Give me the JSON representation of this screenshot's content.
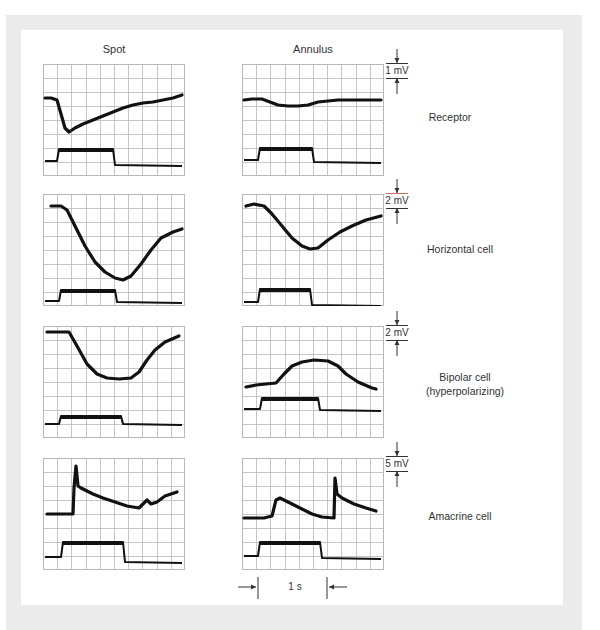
{
  "figure": {
    "column_titles": [
      "Spot",
      "Annulus"
    ],
    "rows": [
      {
        "label_lines": [
          "Receptor"
        ],
        "scale_label": "1 mV",
        "spot_trace": [
          [
            2,
            34
          ],
          [
            8,
            34
          ],
          [
            14,
            36
          ],
          [
            18,
            50
          ],
          [
            22,
            64
          ],
          [
            26,
            68
          ],
          [
            32,
            64
          ],
          [
            40,
            60
          ],
          [
            50,
            56
          ],
          [
            60,
            52
          ],
          [
            70,
            48
          ],
          [
            80,
            44
          ],
          [
            90,
            41
          ],
          [
            100,
            39
          ],
          [
            110,
            38
          ],
          [
            120,
            36
          ],
          [
            130,
            34
          ],
          [
            139,
            31
          ]
        ],
        "annulus_trace": [
          [
            2,
            36
          ],
          [
            10,
            35
          ],
          [
            20,
            35
          ],
          [
            28,
            38
          ],
          [
            36,
            41
          ],
          [
            46,
            42
          ],
          [
            56,
            42
          ],
          [
            66,
            41
          ],
          [
            76,
            38
          ],
          [
            86,
            37
          ],
          [
            96,
            36
          ],
          [
            110,
            36
          ],
          [
            124,
            36
          ],
          [
            139,
            36
          ]
        ],
        "spot_stim": {
          "base": 97,
          "high": 85,
          "on": 14,
          "off": 70,
          "end_base": 101
        },
        "annulus_stim": {
          "base": 96,
          "high": 84,
          "on": 16,
          "off": 70,
          "end_base": 98
        }
      },
      {
        "label_lines": [
          "Horizontal cell"
        ],
        "scale_label": "2 mV",
        "spot_trace": [
          [
            8,
            12
          ],
          [
            18,
            12
          ],
          [
            24,
            16
          ],
          [
            32,
            32
          ],
          [
            42,
            52
          ],
          [
            52,
            68
          ],
          [
            62,
            78
          ],
          [
            72,
            84
          ],
          [
            80,
            86
          ],
          [
            88,
            82
          ],
          [
            98,
            70
          ],
          [
            108,
            56
          ],
          [
            118,
            44
          ],
          [
            130,
            38
          ],
          [
            139,
            35
          ]
        ],
        "annulus_trace": [
          [
            4,
            12
          ],
          [
            12,
            10
          ],
          [
            22,
            12
          ],
          [
            30,
            20
          ],
          [
            40,
            32
          ],
          [
            50,
            44
          ],
          [
            60,
            52
          ],
          [
            68,
            55
          ],
          [
            76,
            54
          ],
          [
            86,
            46
          ],
          [
            98,
            38
          ],
          [
            110,
            32
          ],
          [
            124,
            26
          ],
          [
            139,
            22
          ]
        ],
        "spot_stim": {
          "base": 107,
          "high": 96,
          "on": 16,
          "off": 72,
          "end_base": 108
        },
        "annulus_stim": {
          "base": 108,
          "high": 95,
          "on": 16,
          "off": 68,
          "end_base": 111
        }
      },
      {
        "label_lines": [
          "Bipolar cell",
          "(hyperpolarizing)"
        ],
        "scale_label": "2 mV",
        "spot_trace": [
          [
            4,
            6
          ],
          [
            26,
            6
          ],
          [
            34,
            20
          ],
          [
            44,
            38
          ],
          [
            54,
            48
          ],
          [
            64,
            52
          ],
          [
            76,
            53
          ],
          [
            88,
            52
          ],
          [
            96,
            46
          ],
          [
            104,
            34
          ],
          [
            112,
            24
          ],
          [
            122,
            16
          ],
          [
            136,
            10
          ]
        ],
        "annulus_trace": [
          [
            4,
            61
          ],
          [
            14,
            59
          ],
          [
            24,
            58
          ],
          [
            34,
            57
          ],
          [
            42,
            48
          ],
          [
            50,
            40
          ],
          [
            60,
            36
          ],
          [
            72,
            34
          ],
          [
            86,
            35
          ],
          [
            96,
            40
          ],
          [
            104,
            48
          ],
          [
            116,
            56
          ],
          [
            130,
            62
          ],
          [
            134,
            63
          ]
        ],
        "spot_stim": {
          "base": 98,
          "high": 90,
          "on": 16,
          "off": 78,
          "end_base": 98
        },
        "annulus_stim": {
          "base": 83,
          "high": 72,
          "on": 18,
          "off": 76,
          "end_base": 84
        }
      },
      {
        "label_lines": [
          "Amacrine cell"
        ],
        "scale_label": "5 mV",
        "spot_trace": [
          [
            4,
            56
          ],
          [
            30,
            56
          ],
          [
            31,
            30
          ],
          [
            33,
            8
          ],
          [
            35,
            28
          ],
          [
            38,
            30
          ],
          [
            50,
            36
          ],
          [
            60,
            40
          ],
          [
            72,
            44
          ],
          [
            84,
            48
          ],
          [
            96,
            50
          ],
          [
            100,
            46
          ],
          [
            104,
            42
          ],
          [
            108,
            46
          ],
          [
            114,
            44
          ],
          [
            122,
            38
          ],
          [
            134,
            34
          ]
        ],
        "annulus_trace": [
          [
            2,
            60
          ],
          [
            22,
            60
          ],
          [
            30,
            58
          ],
          [
            34,
            42
          ],
          [
            38,
            40
          ],
          [
            46,
            44
          ],
          [
            58,
            50
          ],
          [
            70,
            56
          ],
          [
            80,
            59
          ],
          [
            92,
            60
          ],
          [
            93,
            20
          ],
          [
            95,
            36
          ],
          [
            100,
            40
          ],
          [
            112,
            46
          ],
          [
            124,
            50
          ],
          [
            134,
            53
          ]
        ],
        "spot_stim": {
          "base": 99,
          "high": 84,
          "on": 18,
          "off": 80,
          "end_base": 104
        },
        "annulus_stim": {
          "base": 98,
          "high": 84,
          "on": 16,
          "off": 78,
          "end_base": 100
        }
      }
    ],
    "time_scale_label": "1 s",
    "colors": {
      "frame_gray": "#ebebeb",
      "grid_line": "#b8b8b8",
      "trace": "#111111",
      "marker_accent": "#d46a6a"
    }
  }
}
